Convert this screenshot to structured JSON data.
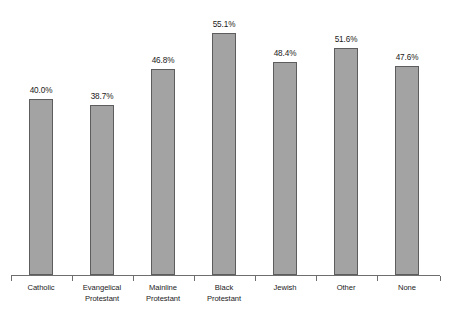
{
  "chart_data": {
    "type": "bar",
    "title": "",
    "subtitle": "",
    "xlabel": "",
    "ylabel": "",
    "categories": [
      "Catholic",
      "Evangelical Protestant",
      "Mainline Protestant",
      "Black Protestant",
      "Jewish",
      "Other",
      "None"
    ],
    "category_lines": [
      [
        "Catholic"
      ],
      [
        "Evangelical",
        "Protestant"
      ],
      [
        "Mainline",
        "Protestant"
      ],
      [
        "Black",
        "Protestant"
      ],
      [
        "Jewish"
      ],
      [
        "Other"
      ],
      [
        "None"
      ]
    ],
    "values": [
      40.0,
      38.7,
      46.8,
      55.1,
      48.4,
      51.6,
      47.6
    ],
    "value_labels": [
      "40.0%",
      "38.7%",
      "46.8%",
      "55.1%",
      "48.4%",
      "51.6%",
      "47.6%"
    ],
    "ylim": [
      0,
      63
    ],
    "grid": false,
    "legend": null,
    "y_axis_visible": false,
    "x_axis_visible": true,
    "bar_color": "#a3a3a3",
    "bar_border_color": "#5d5d5d",
    "axis_color": "#6e6e6e",
    "background_color": "#ffffff",
    "text_color": "#1a1a1a"
  },
  "layout": {
    "baseline_y": 275,
    "axis_left": 11,
    "axis_right": 440,
    "bar_width": 24,
    "first_bar_center": 41,
    "bar_pitch": 61,
    "px_per_percent": 4.395,
    "tick_height": 5,
    "label_top_offset": 8,
    "value_gap": 4
  }
}
